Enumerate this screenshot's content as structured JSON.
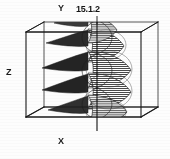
{
  "figure": {
    "number": "15.1.2",
    "kind": "3d-wireframe-box-with-hatched-wave-surface",
    "background_color": "#fdfdfd",
    "ink_color": "#1a1a1a",
    "hatch_color": "#555555",
    "spike_fill_color": "#2b2b2b",
    "axes": {
      "y_label": "Y",
      "z_label": "Z",
      "x_label": "X"
    },
    "box": {
      "front_top_left": [
        26,
        32
      ],
      "front_top_right": [
        141,
        32
      ],
      "front_bottom_left": [
        26,
        117
      ],
      "front_bottom_right": [
        141,
        117
      ],
      "back_top_left": [
        44,
        22
      ],
      "back_top_right": [
        158,
        22
      ],
      "back_bottom_left": [
        44,
        107
      ],
      "back_bottom_right": [
        158,
        107
      ]
    },
    "vertical_axis_line_x": 97,
    "wave": {
      "lobe_count": 4,
      "spike_count": 3,
      "hatch_line_spacing_px": 2,
      "description": "standing-wave mode surface, alternating left-pointing dark spikes and right-bulging hatched lobes"
    }
  }
}
